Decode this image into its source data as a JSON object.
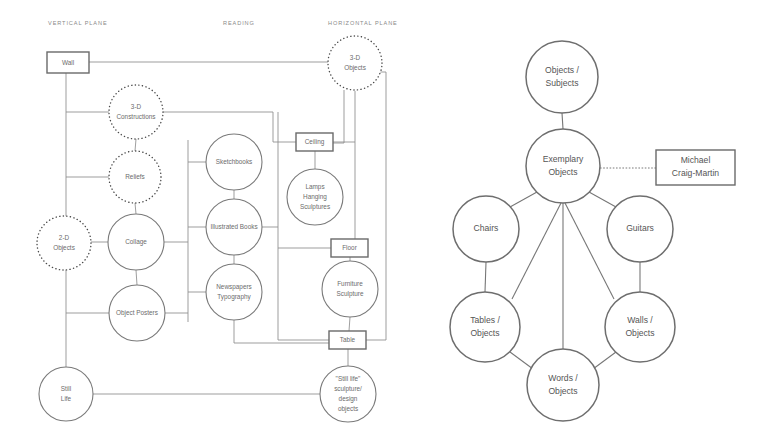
{
  "page": {
    "background_color": "#ffffff"
  },
  "left_diagram": {
    "name": "vertical-horizontal-plane-diagram",
    "column_headers": [
      {
        "id": "vertical-plane",
        "label": "VERTICAL PLANE",
        "x": 48,
        "y": 24
      },
      {
        "id": "reading",
        "label": "READING",
        "x": 223,
        "y": 24
      },
      {
        "id": "horizontal-plane",
        "label": "HORIZONTAL PLANE",
        "x": 328,
        "y": 24
      }
    ],
    "boxes": [
      {
        "id": "wall",
        "label": "Wall",
        "x": 47,
        "y": 52,
        "w": 42,
        "h": 21
      },
      {
        "id": "ceiling",
        "label": "Ceiling",
        "x": 296,
        "y": 133,
        "w": 37,
        "h": 18
      },
      {
        "id": "floor",
        "label": "Floor",
        "x": 331,
        "y": 239,
        "w": 37,
        "h": 18
      },
      {
        "id": "table",
        "label": "Table",
        "x": 329,
        "y": 331,
        "w": 37,
        "h": 18
      }
    ],
    "dotted_circles": [
      {
        "id": "3d-objects",
        "lines": [
          "3-D",
          "Objects"
        ],
        "cx": 355,
        "cy": 63,
        "r": 27
      },
      {
        "id": "3d-constructions",
        "lines": [
          "3-D",
          "Constructions"
        ],
        "cx": 136,
        "cy": 112,
        "r": 27
      },
      {
        "id": "reliefs",
        "lines": [
          "Reliefs"
        ],
        "cx": 135,
        "cy": 177,
        "r": 26
      },
      {
        "id": "2d-objects",
        "lines": [
          "2-D",
          "Objects"
        ],
        "cx": 64,
        "cy": 243,
        "r": 27
      }
    ],
    "solid_circles": [
      {
        "id": "sketchbooks",
        "lines": [
          "Sketchbooks"
        ],
        "cx": 234,
        "cy": 162,
        "r": 28
      },
      {
        "id": "illustrated-books",
        "lines": [
          "Illustrated Books"
        ],
        "cx": 234,
        "cy": 227,
        "r": 28
      },
      {
        "id": "newspapers-typography",
        "lines": [
          "Newspapers",
          "Typography"
        ],
        "cx": 234,
        "cy": 292,
        "r": 28
      },
      {
        "id": "collage",
        "lines": [
          "Collage"
        ],
        "cx": 136,
        "cy": 242,
        "r": 28
      },
      {
        "id": "object-posters",
        "lines": [
          "Object Posters"
        ],
        "cx": 137,
        "cy": 313,
        "r": 28
      },
      {
        "id": "lamps-hanging-sculptures",
        "lines": [
          "Lamps",
          "Hanging",
          "Sculptures"
        ],
        "cx": 315,
        "cy": 197,
        "r": 28
      },
      {
        "id": "furniture-sculpture",
        "lines": [
          "Furniture",
          "Sculpture"
        ],
        "cx": 350,
        "cy": 289,
        "r": 28
      },
      {
        "id": "still-life",
        "lines": [
          "Still",
          "Life"
        ],
        "cx": 66,
        "cy": 394,
        "r": 27
      },
      {
        "id": "still-life-sculpture-design-objects",
        "lines": [
          "\"Still life\"",
          "sculpture/",
          "design",
          "objects"
        ],
        "cx": 348,
        "cy": 394,
        "r": 28
      }
    ]
  },
  "right_diagram": {
    "name": "exemplary-objects-network",
    "boxes": [
      {
        "id": "michael-craig-martin",
        "lines": [
          "Michael",
          "Craig-Martin"
        ],
        "x": 656,
        "y": 150,
        "w": 79,
        "h": 35
      }
    ],
    "circles": [
      {
        "id": "objects-subjects",
        "lines": [
          "Objects /",
          "Subjects"
        ],
        "cx": 562,
        "cy": 77,
        "r": 36
      },
      {
        "id": "exemplary-objects",
        "lines": [
          "Exemplary",
          "Objects"
        ],
        "cx": 563,
        "cy": 166,
        "r": 37
      },
      {
        "id": "chairs",
        "lines": [
          "Chairs"
        ],
        "cx": 486,
        "cy": 229,
        "r": 33
      },
      {
        "id": "guitars",
        "lines": [
          "Guitars"
        ],
        "cx": 640,
        "cy": 229,
        "r": 33
      },
      {
        "id": "tables-objects",
        "lines": [
          "Tables /",
          "Objects"
        ],
        "cx": 485,
        "cy": 327,
        "r": 35
      },
      {
        "id": "walls-objects",
        "lines": [
          "Walls /",
          "Objects"
        ],
        "cx": 640,
        "cy": 327,
        "r": 35
      },
      {
        "id": "words-objects",
        "lines": [
          "Words /",
          "Objects"
        ],
        "cx": 563,
        "cy": 385,
        "r": 36
      }
    ]
  },
  "colors": {
    "stroke_light": "#8d8d8d",
    "stroke_medium": "#7a7a7a",
    "stroke_dark": "#4a4a4a",
    "text_gray": "#6b6b6b",
    "header_gray": "#8a8a8a"
  }
}
